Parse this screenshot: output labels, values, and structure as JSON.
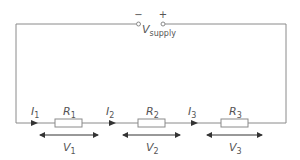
{
  "colors": {
    "wire": "#8a8a8a",
    "text": "#555555",
    "arrow": "#333333",
    "resistor_fill": "#ffffff"
  },
  "supply": {
    "label": "V",
    "subscript": "supply",
    "negative_symbol": "−",
    "positive_symbol": "+"
  },
  "resistors": [
    {
      "label": "R",
      "subscript": "1"
    },
    {
      "label": "R",
      "subscript": "2"
    },
    {
      "label": "R",
      "subscript": "3"
    }
  ],
  "currents": [
    {
      "label": "I",
      "subscript": "1"
    },
    {
      "label": "I",
      "subscript": "2"
    },
    {
      "label": "I",
      "subscript": "3"
    }
  ],
  "voltages": [
    {
      "label": "V",
      "subscript": "1"
    },
    {
      "label": "V",
      "subscript": "2"
    },
    {
      "label": "V",
      "subscript": "3"
    }
  ]
}
